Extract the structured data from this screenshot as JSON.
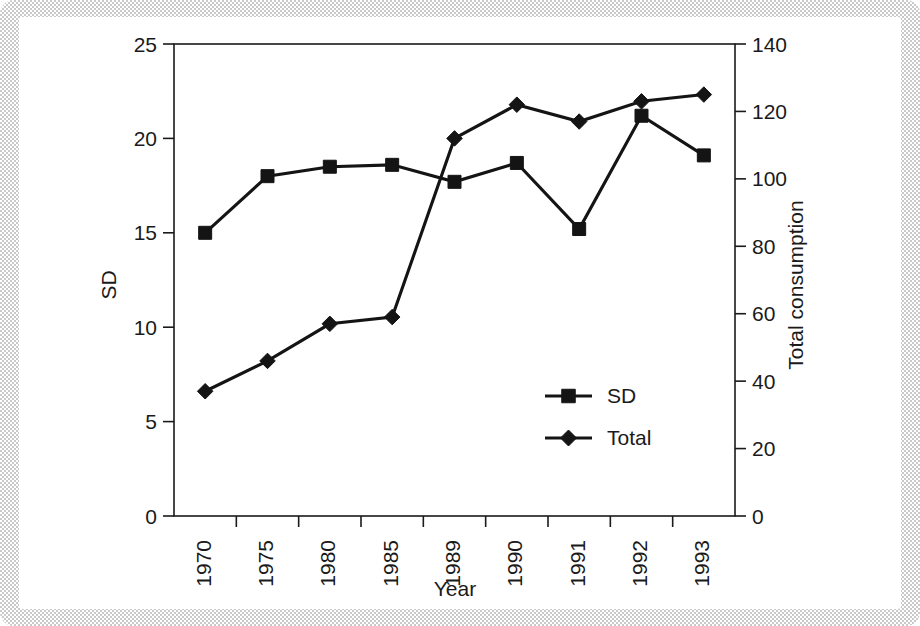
{
  "figure": {
    "frame_color": "#c9c9c9",
    "page_color": "#ffffff",
    "ink_color": "#141414"
  },
  "chart_data": {
    "type": "line",
    "title": "",
    "xlabel": "Year",
    "ylabel": "SD",
    "y2label": "Total consumption",
    "categories": [
      "1970",
      "1975",
      "1980",
      "1985",
      "1989",
      "1990",
      "1991",
      "1992",
      "1993"
    ],
    "ylim": [
      0,
      25
    ],
    "y2lim": [
      0,
      140
    ],
    "yticks": [
      "0",
      "5",
      "10",
      "15",
      "20",
      "25"
    ],
    "ytick_values": [
      0,
      5,
      10,
      15,
      20,
      25
    ],
    "y2ticks": [
      "0",
      "20",
      "40",
      "60",
      "80",
      "100",
      "120",
      "140"
    ],
    "y2tick_values": [
      0,
      20,
      40,
      60,
      80,
      100,
      120,
      140
    ],
    "grid": false,
    "legend_position": "center-right-inside",
    "series": [
      {
        "name": "SD",
        "axis": "left",
        "marker": "square",
        "values": [
          15.0,
          18.0,
          18.5,
          18.6,
          17.7,
          18.7,
          15.2,
          21.2,
          19.1
        ]
      },
      {
        "name": "Total",
        "axis": "right",
        "marker": "diamond",
        "values": [
          37,
          46,
          57,
          59,
          112,
          122,
          117,
          123,
          125
        ]
      }
    ]
  },
  "legend": {
    "entries": [
      {
        "label": "SD",
        "marker": "square"
      },
      {
        "label": "Total",
        "marker": "diamond"
      }
    ]
  }
}
